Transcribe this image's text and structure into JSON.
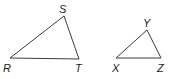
{
  "figure": {
    "triangles": [
      {
        "name": "RST",
        "vertices": [
          {
            "label": "R",
            "x": 10,
            "y": 58,
            "lx": 3,
            "ly": 72
          },
          {
            "label": "S",
            "x": 64,
            "y": 16,
            "lx": 59,
            "ly": 13
          },
          {
            "label": "T",
            "x": 79,
            "y": 59,
            "lx": 75,
            "ly": 72
          }
        ]
      },
      {
        "name": "XYZ",
        "vertices": [
          {
            "label": "X",
            "x": 116,
            "y": 58,
            "lx": 112,
            "ly": 72
          },
          {
            "label": "Y",
            "x": 147,
            "y": 30,
            "lx": 143,
            "ly": 27
          },
          {
            "label": "Z",
            "x": 161,
            "y": 58,
            "lx": 157,
            "ly": 72
          }
        ]
      }
    ],
    "colors": {
      "line": "#3a3a3a",
      "text": "#1a1a1a",
      "background": "#ffffff"
    }
  }
}
